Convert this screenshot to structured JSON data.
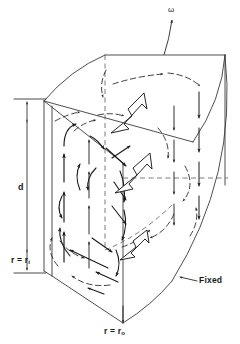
{
  "figure": {
    "kind": "engineering-3d-diagram",
    "background_color": "#ffffff",
    "line_color": "#1a1a1a",
    "width": 240,
    "height": 344
  },
  "labels": {
    "omega": "ω",
    "gap_height": "d",
    "inner_radius_prefix": "r = r",
    "inner_radius_subscript": "i",
    "outer_radius_prefix": "r = r",
    "outer_radius_subscript": "o",
    "fixed_wall": "Fixed"
  },
  "annotations": [
    {
      "name": "omega-arrow",
      "text": "ω",
      "meaning": "angular velocity of rotating wall",
      "x": 172,
      "y": 12
    },
    {
      "name": "gap-dimension",
      "text": "d",
      "meaning": "axial gap height between end walls",
      "x": 21,
      "y": 188
    },
    {
      "name": "inner-radius-label",
      "text": "r = r i",
      "meaning": "inner cylinder radius surface",
      "x": 13,
      "y": 261
    },
    {
      "name": "outer-radius-label",
      "text": "r = r o",
      "meaning": "outer cylinder radius surface",
      "x": 106,
      "y": 332
    },
    {
      "name": "fixed-label",
      "text": "Fixed",
      "meaning": "stationary outer curved wall",
      "x": 201,
      "y": 281
    }
  ],
  "geometry": {
    "top_face_corners": [
      [
        105,
        55
      ],
      [
        225,
        55
      ],
      [
        193,
        142
      ],
      [
        44,
        101
      ]
    ],
    "bottom_front_corner": [
      123,
      323
    ],
    "left_panel_top": [
      44,
      101
    ],
    "left_panel_bottom": [
      44,
      271
    ],
    "curved_outer_surface": "arc from (225,55) bowing right to (172,281)",
    "inner_curved_surface": "arc from (105,55) through (60,96) to (44,101)"
  },
  "flow": {
    "description": "Meridional recirculation cells between a rotating end wall and fixed outer cylinder",
    "inner_wall_arrows": "upward",
    "outer_wall_arrows": "downward",
    "azimuthal_arrows": "large hollow arrows directed up-right",
    "recirculation_arcs": "dashed curved arcs"
  },
  "style": {
    "solid_arrow_color": "#1a1a1a",
    "dashed_arc_color": "#2b2b2b",
    "edge_color": "#3a3a3a",
    "hollow_arrow_fill": "#ffffff",
    "hollow_arrow_stroke": "#1a1a1a"
  }
}
